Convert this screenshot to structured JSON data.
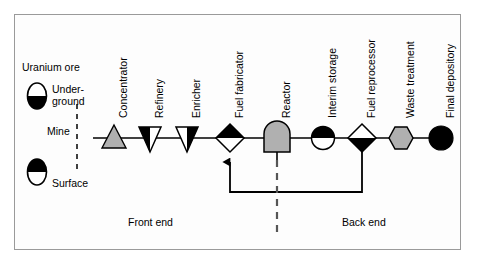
{
  "figure": {
    "background": "#ffffff",
    "frame_color": "#9a9a9a",
    "line_color": "#000000",
    "gray_fill": "#b0b0b0",
    "black_fill": "#000000",
    "white_fill": "#ffffff"
  },
  "legend": {
    "heading": "Uranium ore",
    "mine_label": "Mine",
    "items": [
      {
        "label_line1": "Under-",
        "label_line2": "ground",
        "shape": "ellipse-top-white-bottom-black"
      },
      {
        "label_line1": "Surface",
        "label_line2": "",
        "shape": "ellipse-top-black-bottom-white"
      }
    ]
  },
  "zones": [
    {
      "label": "Front end"
    },
    {
      "label": "Back end"
    }
  ],
  "nodes": [
    {
      "id": "concentrator",
      "label": "Concentrator",
      "shape": "triangle-up-gray",
      "x": 114
    },
    {
      "id": "refinery",
      "label": "Refinery",
      "shape": "triangle-down-left-black",
      "x": 150
    },
    {
      "id": "enricher",
      "label": "Enricher",
      "shape": "triangle-down-right-black",
      "x": 187
    },
    {
      "id": "fuel-fabricator",
      "label": "Fuel fabricator",
      "shape": "diamond-top-black",
      "x": 230
    },
    {
      "id": "reactor",
      "label": "Reactor",
      "shape": "dome-gray",
      "x": 277
    },
    {
      "id": "interim-storage",
      "label": "Interim storage",
      "shape": "circle-top-black",
      "x": 323
    },
    {
      "id": "fuel-reprocessor",
      "label": "Fuel reprocessor",
      "shape": "diamond-bottom-black",
      "x": 362
    },
    {
      "id": "waste-treatment",
      "label": "Waste treatment",
      "shape": "hexagon-gray",
      "x": 401
    },
    {
      "id": "final-depository",
      "label": "Final depository",
      "shape": "circle-black",
      "x": 441
    }
  ]
}
